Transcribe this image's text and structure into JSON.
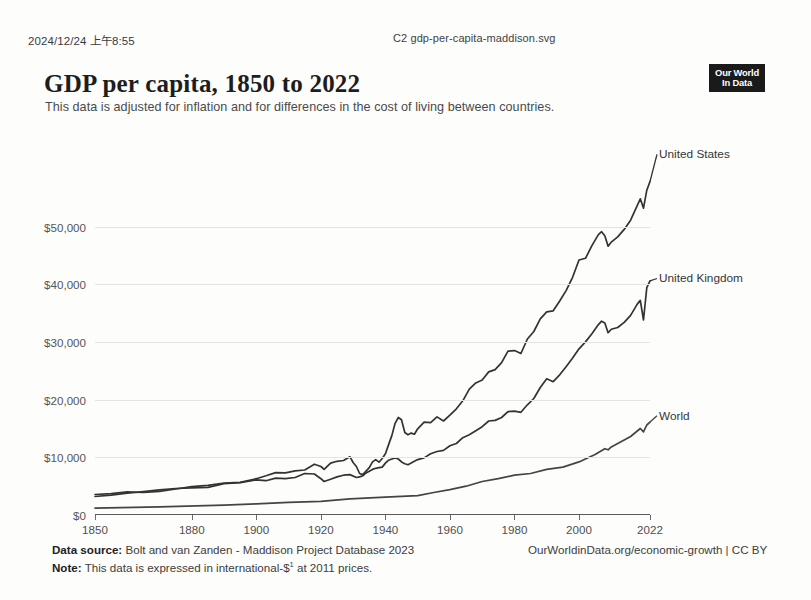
{
  "print_header": {
    "date": "2024/12/24 上午8:55",
    "filename": "C2 gdp-per-capita-maddison.svg"
  },
  "header": {
    "title": "GDP per capita, 1850 to 2022",
    "subtitle": "This data is adjusted for inflation and for differences in the cost of living between countries.",
    "logo_line1": "Our World",
    "logo_line2": "In Data"
  },
  "footer": {
    "source_label": "Data source:",
    "source_text": "Bolt and van Zanden - Maddison Project Database 2023",
    "note_label": "Note:",
    "note_text_before": "This data is expressed in international-$",
    "note_superscript": "1",
    "note_text_after": " at 2011 prices.",
    "attribution": "OurWorldinData.org/economic-growth | CC BY"
  },
  "chart_data": {
    "type": "line",
    "title": "GDP per capita, 1850 to 2022",
    "subtitle": "This data is adjusted for inflation and for differences in the cost of living between countries.",
    "xlabel": "",
    "ylabel": "",
    "xlim": [
      1850,
      2022
    ],
    "ylim": [
      0,
      65000
    ],
    "grid": true,
    "legend_position": "right-inline",
    "y_ticks": [
      0,
      10000,
      20000,
      30000,
      40000,
      50000
    ],
    "y_tick_labels": [
      "$0",
      "$10,000",
      "$20,000",
      "$30,000",
      "$40,000",
      "$50,000"
    ],
    "x_ticks": [
      1850,
      1880,
      1900,
      1920,
      1940,
      1960,
      1980,
      2000,
      2022
    ],
    "x_tick_labels": [
      "1850",
      "1880",
      "1900",
      "1920",
      "1940",
      "1960",
      "1980",
      "2000",
      "2022"
    ],
    "series": [
      {
        "name": "United States",
        "color": "#333333",
        "label_y": 62500,
        "x": [
          1850,
          1855,
          1860,
          1865,
          1870,
          1875,
          1880,
          1885,
          1890,
          1895,
          1900,
          1903,
          1906,
          1909,
          1912,
          1915,
          1918,
          1920,
          1921,
          1923,
          1925,
          1927,
          1929,
          1930,
          1931,
          1932,
          1933,
          1934,
          1935,
          1936,
          1937,
          1938,
          1939,
          1940,
          1941,
          1942,
          1943,
          1944,
          1945,
          1946,
          1947,
          1948,
          1949,
          1950,
          1952,
          1954,
          1956,
          1958,
          1960,
          1962,
          1964,
          1966,
          1968,
          1970,
          1972,
          1974,
          1976,
          1978,
          1980,
          1982,
          1984,
          1986,
          1988,
          1990,
          1992,
          1994,
          1996,
          1998,
          2000,
          2002,
          2004,
          2006,
          2007,
          2008,
          2009,
          2010,
          2012,
          2014,
          2016,
          2018,
          2019,
          2020,
          2021,
          2022
        ],
        "y": [
          3550,
          3700,
          4000,
          3900,
          4100,
          4500,
          4900,
          5150,
          5550,
          5650,
          6300,
          6800,
          7350,
          7300,
          7650,
          7800,
          8800,
          8400,
          7900,
          9000,
          9300,
          9450,
          10100,
          9100,
          8400,
          7200,
          7000,
          7600,
          8200,
          9200,
          9600,
          9150,
          9800,
          10600,
          12200,
          13800,
          15900,
          16900,
          16500,
          14300,
          13900,
          14200,
          14000,
          14950,
          16100,
          16000,
          17000,
          16300,
          17300,
          18400,
          19800,
          21800,
          22900,
          23400,
          24800,
          25200,
          26400,
          28400,
          28500,
          28000,
          30500,
          31800,
          34000,
          35200,
          35400,
          37100,
          38900,
          41200,
          44200,
          44500,
          46700,
          48600,
          49100,
          48400,
          46600,
          47300,
          48200,
          49500,
          51100,
          53600,
          54800,
          53200,
          56300,
          57800
        ]
      },
      {
        "name": "United Kingdom",
        "color": "#333333",
        "label_y": 41000,
        "x": [
          1850,
          1855,
          1860,
          1865,
          1870,
          1875,
          1880,
          1885,
          1890,
          1895,
          1900,
          1903,
          1906,
          1909,
          1912,
          1915,
          1918,
          1920,
          1921,
          1923,
          1925,
          1927,
          1929,
          1931,
          1932,
          1933,
          1934,
          1935,
          1936,
          1937,
          1938,
          1939,
          1940,
          1941,
          1942,
          1943,
          1944,
          1945,
          1946,
          1947,
          1948,
          1949,
          1950,
          1952,
          1954,
          1956,
          1958,
          1960,
          1962,
          1964,
          1966,
          1968,
          1970,
          1972,
          1974,
          1976,
          1978,
          1980,
          1982,
          1984,
          1986,
          1988,
          1990,
          1992,
          1994,
          1996,
          1998,
          2000,
          2002,
          2004,
          2006,
          2007,
          2008,
          2009,
          2010,
          2012,
          2014,
          2016,
          2018,
          2019,
          2020,
          2021,
          2022
        ],
        "y": [
          3200,
          3450,
          3800,
          4050,
          4350,
          4600,
          4700,
          4800,
          5450,
          5600,
          6100,
          5950,
          6400,
          6300,
          6500,
          7200,
          7100,
          6300,
          5800,
          6200,
          6600,
          6900,
          7000,
          6500,
          6600,
          6800,
          7300,
          7600,
          7900,
          8100,
          8200,
          8300,
          9000,
          9500,
          9700,
          9900,
          9700,
          9200,
          8900,
          8700,
          9000,
          9300,
          9600,
          9900,
          10600,
          11000,
          11200,
          12000,
          12400,
          13400,
          13900,
          14600,
          15300,
          16300,
          16400,
          16900,
          17900,
          18000,
          17800,
          19100,
          20200,
          22100,
          23600,
          23100,
          24300,
          25700,
          27200,
          28800,
          30000,
          31400,
          33000,
          33600,
          33300,
          31600,
          32200,
          32500,
          33400,
          34600,
          36500,
          37200,
          33800,
          39400,
          40600
        ]
      },
      {
        "name": "World",
        "color": "#444444",
        "label_y": 17200,
        "x": [
          1850,
          1870,
          1890,
          1900,
          1910,
          1920,
          1929,
          1940,
          1950,
          1955,
          1960,
          1965,
          1970,
          1975,
          1980,
          1985,
          1990,
          1995,
          2000,
          2005,
          2008,
          2009,
          2010,
          2013,
          2016,
          2019,
          2020,
          2021,
          2022
        ],
        "y": [
          1180,
          1400,
          1700,
          1950,
          2200,
          2350,
          2800,
          3100,
          3350,
          3900,
          4400,
          5000,
          5800,
          6300,
          6900,
          7200,
          7900,
          8300,
          9200,
          10500,
          11500,
          11300,
          11800,
          12700,
          13600,
          15000,
          14400,
          15600,
          16100
        ]
      }
    ]
  }
}
